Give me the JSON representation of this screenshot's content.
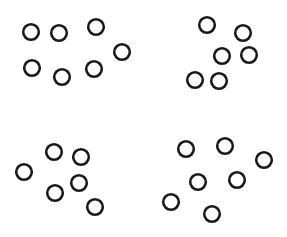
{
  "stimulus": {
    "name": "dot-array-four-clusters",
    "width": 287,
    "height": 237,
    "background_color": "#ffffff",
    "dot_style": {
      "shape": "circle",
      "fill": "none",
      "stroke_color": "#1a1a1a",
      "stroke_width": 2.6,
      "radius": 7.8
    },
    "total_dot_count": 26,
    "clusters": [
      {
        "name": "top-left-cluster",
        "count": 7,
        "dots": [
          {
            "cx": 31,
            "cy": 32
          },
          {
            "cx": 59,
            "cy": 33
          },
          {
            "cx": 96,
            "cy": 27
          },
          {
            "cx": 122,
            "cy": 52
          },
          {
            "cx": 32,
            "cy": 68
          },
          {
            "cx": 94,
            "cy": 69
          },
          {
            "cx": 62,
            "cy": 77
          }
        ]
      },
      {
        "name": "top-right-cluster",
        "count": 6,
        "dots": [
          {
            "cx": 207,
            "cy": 25
          },
          {
            "cx": 243,
            "cy": 33
          },
          {
            "cx": 222,
            "cy": 56
          },
          {
            "cx": 249,
            "cy": 55
          },
          {
            "cx": 195,
            "cy": 80
          },
          {
            "cx": 219,
            "cy": 81
          }
        ]
      },
      {
        "name": "bottom-left-cluster",
        "count": 6,
        "dots": [
          {
            "cx": 54,
            "cy": 152
          },
          {
            "cx": 81,
            "cy": 157
          },
          {
            "cx": 24,
            "cy": 172
          },
          {
            "cx": 79,
            "cy": 183
          },
          {
            "cx": 55,
            "cy": 193
          },
          {
            "cx": 95,
            "cy": 207
          }
        ]
      },
      {
        "name": "bottom-right-cluster",
        "count": 7,
        "dots": [
          {
            "cx": 186,
            "cy": 149
          },
          {
            "cx": 225,
            "cy": 146
          },
          {
            "cx": 264,
            "cy": 160
          },
          {
            "cx": 198,
            "cy": 182
          },
          {
            "cx": 237,
            "cy": 180
          },
          {
            "cx": 171,
            "cy": 202
          },
          {
            "cx": 212,
            "cy": 214
          }
        ]
      }
    ]
  }
}
